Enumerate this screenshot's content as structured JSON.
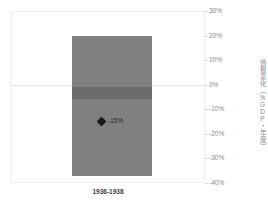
{
  "chart_data": {
    "type": "bar",
    "title": "",
    "subtitle": "",
    "xlabel": "",
    "ylabel": "債務変化（%GDP・年度）",
    "categories": [
      "1936-1938"
    ],
    "ylim": [
      -40,
      30
    ],
    "ytick_labels": [
      "30%",
      "20%",
      "10%",
      "0%",
      "-10%",
      "-20%",
      "-30%",
      "-40%"
    ],
    "ytick_values": [
      30,
      20,
      10,
      0,
      -10,
      -20,
      -30,
      -40
    ],
    "grid": false,
    "legend": null,
    "series": [
      {
        "name": "範囲",
        "type": "range-bar",
        "range_top": 20,
        "range_bottom": -37,
        "color": "#808080"
      },
      {
        "name": "ゼロ帯",
        "type": "band",
        "band_top": -1,
        "band_bottom": -6,
        "color": "#6b6b6b"
      },
      {
        "name": "中央値",
        "type": "marker",
        "value": -15,
        "label": "-15%",
        "color": "#1a1a1a"
      }
    ],
    "annotations": [
      {
        "text": "-15%",
        "value": -15
      }
    ]
  },
  "axis": {
    "y_title": "債務変化（%GDP・年度）",
    "ticks": [
      {
        "label": "30%",
        "value": 30
      },
      {
        "label": "20%",
        "value": 20
      },
      {
        "label": "10%",
        "value": 10
      },
      {
        "label": "0%",
        "value": 0
      },
      {
        "label": "-10%",
        "value": -10
      },
      {
        "label": "-20%",
        "value": -20
      },
      {
        "label": "-30%",
        "value": -30
      },
      {
        "label": "-40%",
        "value": -40
      }
    ]
  },
  "category_label": "1936-1938",
  "marker": {
    "label": "-15%"
  },
  "colors": {
    "bar": "#808080",
    "band": "#6b6b6b",
    "marker": "#1a1a1a",
    "frame": "#ededed",
    "tick_text": "#8a8a8a",
    "category_text": "#3d3d3d"
  }
}
